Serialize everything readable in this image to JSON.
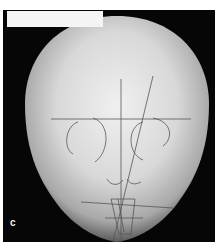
{
  "figure": {
    "panel_label": "c",
    "colors": {
      "background": "#060606",
      "bone_light": "#e6e6e6",
      "bone_mid": "#b8b8b8",
      "tracing": "#555555",
      "label_box": "#f4f4f4"
    }
  }
}
